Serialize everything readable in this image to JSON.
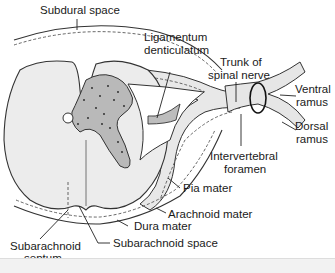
{
  "diagram": {
    "labels": {
      "subdural_space": "Subdural space",
      "ligamentum_line1": "Ligamentum",
      "ligamentum_line2": "denticulatum",
      "trunk_line1": "Trunk of",
      "trunk_line2": "spinal nerve",
      "ventral_line1": "Ventral",
      "ventral_line2": "ramus",
      "dorsal_line1": "Dorsal",
      "dorsal_line2": "ramus",
      "foramen_line1": "Intervertebral",
      "foramen_line2": "foramen",
      "pia_mater": "Pia mater",
      "arachnoid_mater": "Arachnoid mater",
      "dura_mater": "Dura mater",
      "subarachnoid_space": "Subarachnoid space",
      "septum_line1": "Subarachnoid",
      "septum_line2": "septum"
    },
    "colors": {
      "white_matter": "#ececec",
      "gray_matter": "#b9b9b9",
      "nerve": "#e6e6e6",
      "ligament": "#bdbdbd",
      "line": "#333333"
    }
  }
}
